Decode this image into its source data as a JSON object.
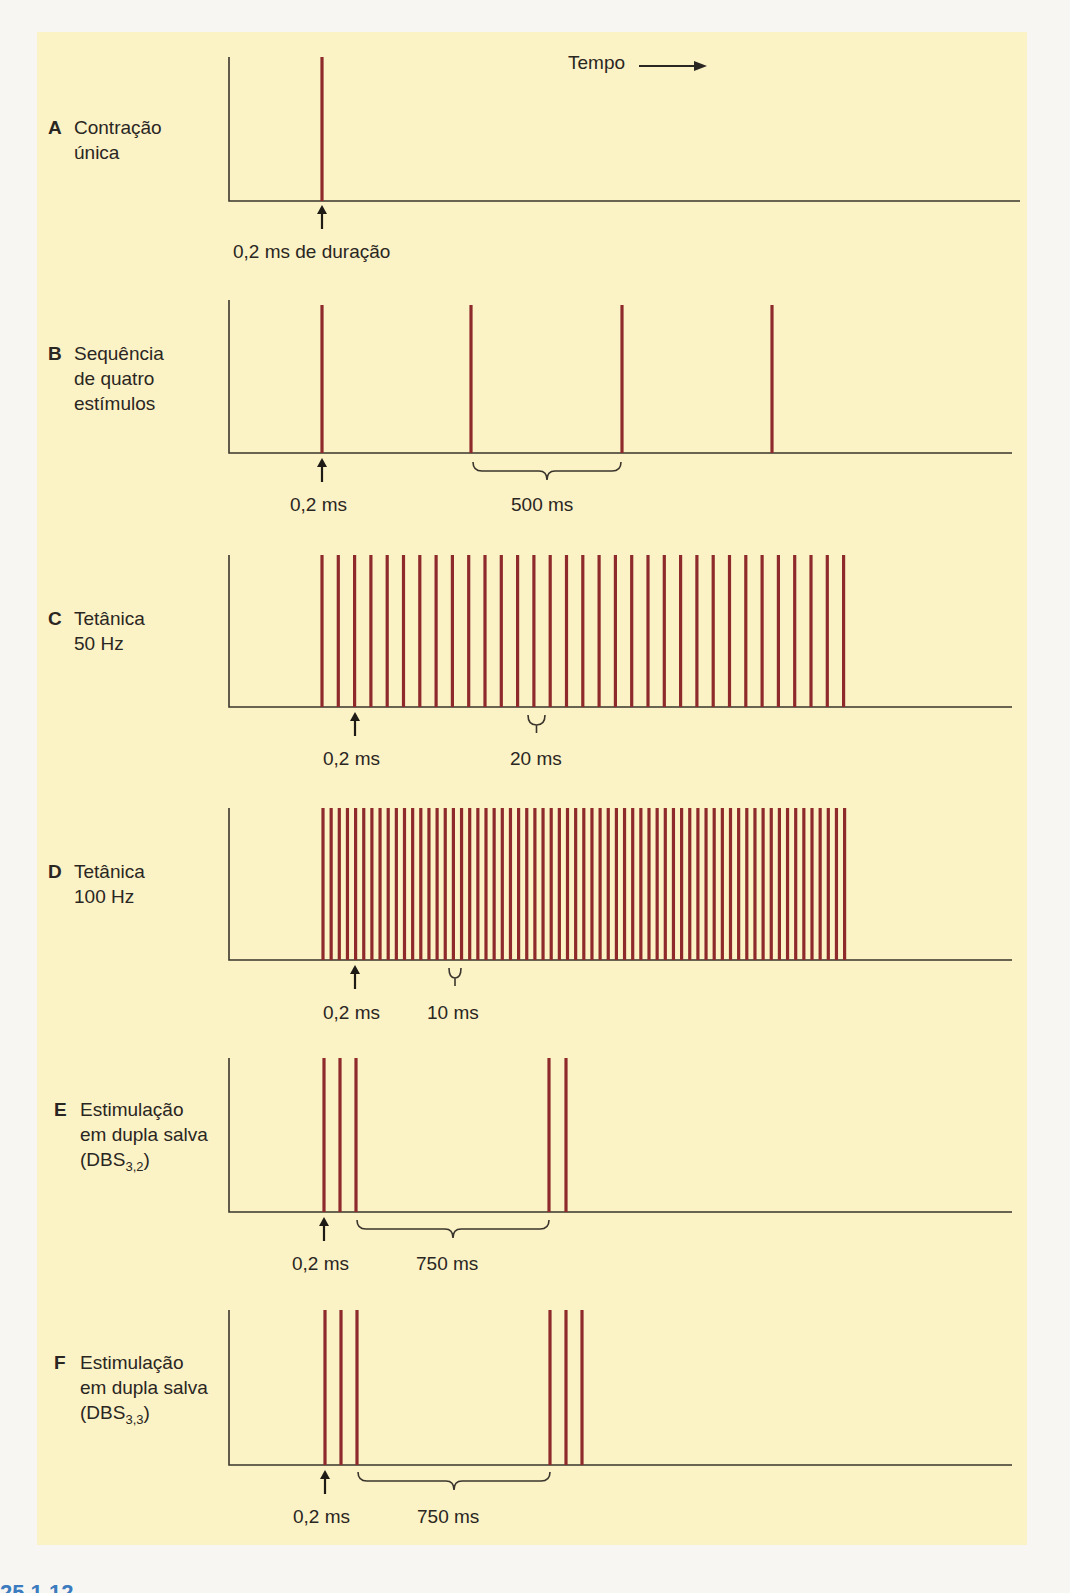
{
  "axis_label": {
    "text": "Tempo",
    "arrow": "right-arrow"
  },
  "panels": [
    {
      "id": "A",
      "title_lines": [
        "Contração",
        "única"
      ],
      "annotation_pulse": "0,2 ms de duração",
      "annotation_interval": ""
    },
    {
      "id": "B",
      "title_lines": [
        "Sequência",
        "de quatro",
        "estímulos"
      ],
      "annotation_pulse": "0,2 ms",
      "annotation_interval": "500 ms"
    },
    {
      "id": "C",
      "title_lines": [
        "Tetânica",
        "50 Hz"
      ],
      "annotation_pulse": "0,2 ms",
      "annotation_interval": "20 ms"
    },
    {
      "id": "D",
      "title_lines": [
        "Tetânica",
        "100 Hz"
      ],
      "annotation_pulse": "0,2 ms",
      "annotation_interval": "10 ms"
    },
    {
      "id": "E",
      "title_lines": [
        "Estimulação",
        "em dupla salva"
      ],
      "title_sub": {
        "prefix": "(DBS",
        "subscript": "3,2",
        "suffix": ")"
      },
      "annotation_pulse": "0,2 ms",
      "annotation_interval": "750 ms"
    },
    {
      "id": "F",
      "title_lines": [
        "Estimulação",
        "em dupla salva"
      ],
      "title_sub": {
        "prefix": "(DBS",
        "subscript": "3,3",
        "suffix": ")"
      },
      "annotation_pulse": "0,2 ms",
      "annotation_interval": "750 ms"
    }
  ],
  "figure_number_fragment": "25.1.12",
  "colors": {
    "pulse": "#8e2a2c",
    "axis": "#3a352c",
    "background": "#fbf2c6",
    "page": "#f7f6f2",
    "figure_number": "#3b7bbf"
  },
  "chart_data": {
    "type": "timing-diagram",
    "xlabel": "Tempo",
    "panels": [
      {
        "id": "A",
        "name": "Contração única",
        "pulse_width_ms": 0.2,
        "pulses": 1
      },
      {
        "id": "B",
        "name": "Sequência de quatro estímulos",
        "pulse_width_ms": 0.2,
        "interval_ms": 500,
        "pulses": 4
      },
      {
        "id": "C",
        "name": "Tetânica 50 Hz",
        "pulse_width_ms": 0.2,
        "interval_ms": 20,
        "frequency_hz": 50,
        "pulses_drawn": 33
      },
      {
        "id": "D",
        "name": "Tetânica 100 Hz",
        "pulse_width_ms": 0.2,
        "interval_ms": 10,
        "frequency_hz": 100,
        "pulses_drawn": 65
      },
      {
        "id": "E",
        "name": "Estimulação em dupla salva (DBS3,2)",
        "pulse_width_ms": 0.2,
        "burst_interval_ms": 750,
        "bursts": [
          3,
          2
        ]
      },
      {
        "id": "F",
        "name": "Estimulação em dupla salva (DBS3,3)",
        "pulse_width_ms": 0.2,
        "burst_interval_ms": 750,
        "bursts": [
          3,
          3
        ]
      }
    ]
  }
}
